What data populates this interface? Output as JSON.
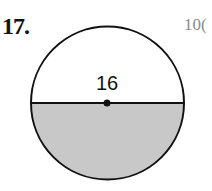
{
  "problem": {
    "number": "17.",
    "figure": {
      "shape": "circle",
      "diameter_label": "16",
      "shaded_region": "lower semicircle",
      "shade_color": "#c8c8c8",
      "stroke_color": "#111111"
    }
  },
  "side_text": "10("
}
